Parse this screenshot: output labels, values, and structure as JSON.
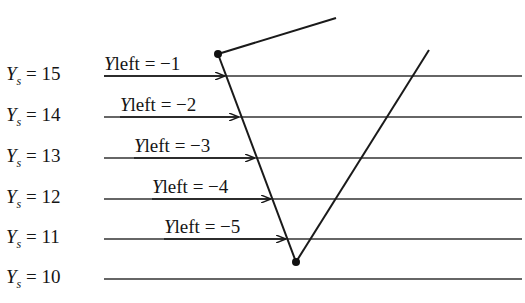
{
  "diagram": {
    "title": "",
    "scanlines": [
      {
        "ys_var": "Y",
        "ys_sub": "s",
        "ys_text": "= 15",
        "y": 76,
        "yleft_var": "Y",
        "yleft_text": "left = −1",
        "label_x": 104,
        "label_y": 56,
        "arrow_x": 224
      },
      {
        "ys_var": "Y",
        "ys_sub": "s",
        "ys_text": "= 14",
        "y": 117,
        "yleft_var": "Y",
        "yleft_text": "left = −2",
        "label_x": 120,
        "label_y": 97,
        "arrow_x": 238
      },
      {
        "ys_var": "Y",
        "ys_sub": "s",
        "ys_text": "= 13",
        "y": 158,
        "yleft_var": "Y",
        "yleft_text": "left = −3",
        "label_x": 134,
        "label_y": 138,
        "arrow_x": 254
      },
      {
        "ys_var": "Y",
        "ys_sub": "s",
        "ys_text": "= 12",
        "y": 199,
        "yleft_var": "Y",
        "yleft_text": "left = −4",
        "label_x": 152,
        "label_y": 179,
        "arrow_x": 270
      },
      {
        "ys_var": "Y",
        "ys_sub": "s",
        "ys_text": "= 11",
        "y": 239,
        "yleft_var": "Y",
        "yleft_text": "left = −5",
        "label_x": 164,
        "label_y": 219,
        "arrow_x": 285
      },
      {
        "ys_var": "Y",
        "ys_sub": "s",
        "ys_text": "= 10",
        "y": 279
      }
    ],
    "scanline_x_start": 104,
    "scanline_x_end": 522,
    "polygon": {
      "top_vertex": {
        "x": 218,
        "y": 54
      },
      "bottom_vertex": {
        "x": 296,
        "y": 262
      },
      "upper_edge_end": {
        "x": 336,
        "y": 18
      },
      "right_edge_end": {
        "x": 429,
        "y": 50
      }
    },
    "colors": {
      "line": "#1a1a1a",
      "scanline": "#333333",
      "background": "#ffffff"
    }
  }
}
